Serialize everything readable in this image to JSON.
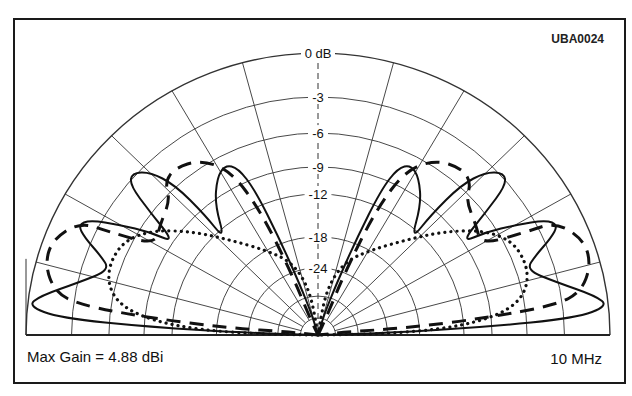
{
  "figure_id": "UBA0024",
  "footer": {
    "max_gain": "Max Gain = 4.88 dBi",
    "frequency": "10 MHz"
  },
  "chart_data": {
    "type": "polar",
    "subtype": "elevation radiation pattern (half-plane)",
    "title": "",
    "annotations": [
      "UBA0024",
      "Max Gain = 4.88 dBi",
      "10 MHz"
    ],
    "radial_axis": {
      "unit": "dB",
      "tick_labels": [
        "0 dB",
        "-3",
        "-6",
        "-9",
        "-12",
        "-18",
        "-24"
      ],
      "ring_values_db": [
        0,
        -3,
        -6,
        -9,
        -12,
        -18,
        -24,
        -30,
        -40
      ],
      "ring_radius_fraction": [
        1.0,
        0.844,
        0.716,
        0.596,
        0.5,
        0.348,
        0.238,
        0.138,
        0.06
      ]
    },
    "angular_axis": {
      "range_deg": [
        0,
        180
      ],
      "spoke_step_deg": 15,
      "spokes_deg": [
        15,
        30,
        45,
        60,
        75,
        90,
        105,
        120,
        135,
        150,
        165
      ]
    },
    "geometry": {
      "cx": 318,
      "cy": 335,
      "rx": 292,
      "ry": 282
    },
    "series": [
      {
        "name": "solid",
        "style": "solid",
        "description": "Multi-lobe pattern; peak lobes near -9 dB at ~40° and ~60° elevation, low-angle lobe reaching 0 dB ring near horizon",
        "points_px_left": [
          [
            318,
            335
          ],
          [
            250,
            333
          ],
          [
            150,
            327
          ],
          [
            60,
            318
          ],
          [
            28,
            306
          ],
          [
            40,
            296
          ],
          [
            80,
            282
          ],
          [
            110,
            270
          ],
          [
            100,
            255
          ],
          [
            85,
            238
          ],
          [
            78,
            225
          ],
          [
            90,
            220
          ],
          [
            120,
            225
          ],
          [
            150,
            232
          ],
          [
            175,
            243
          ],
          [
            150,
            212
          ],
          [
            130,
            185
          ],
          [
            132,
            173
          ],
          [
            150,
            172
          ],
          [
            175,
            185
          ],
          [
            205,
            215
          ],
          [
            225,
            240
          ],
          [
            215,
            205
          ],
          [
            217,
            178
          ],
          [
            225,
            165
          ],
          [
            238,
            168
          ],
          [
            255,
            190
          ],
          [
            280,
            240
          ],
          [
            300,
            285
          ],
          [
            312,
            315
          ],
          [
            318,
            335
          ]
        ]
      },
      {
        "name": "dashed",
        "style": "dashed",
        "description": "Lobes peaking near -9 dB around 55° and -6 dB region at low angles",
        "points_px_left": [
          [
            318,
            335
          ],
          [
            290,
            332
          ],
          [
            230,
            328
          ],
          [
            150,
            318
          ],
          [
            80,
            305
          ],
          [
            55,
            292
          ],
          [
            45,
            265
          ],
          [
            52,
            240
          ],
          [
            80,
            222
          ],
          [
            110,
            232
          ],
          [
            155,
            245
          ],
          [
            160,
            225
          ],
          [
            170,
            200
          ],
          [
            165,
            182
          ],
          [
            175,
            168
          ],
          [
            200,
            160
          ],
          [
            230,
            170
          ],
          [
            260,
            210
          ],
          [
            290,
            270
          ],
          [
            310,
            318
          ],
          [
            318,
            335
          ]
        ]
      },
      {
        "name": "dotted",
        "style": "dotted",
        "description": "Smooth broad pattern around -18 dB ring, nulls at zenith and horizon",
        "points_px_left": [
          [
            318,
            335
          ],
          [
            260,
            334
          ],
          [
            200,
            330
          ],
          [
            150,
            320
          ],
          [
            120,
            305
          ],
          [
            108,
            285
          ],
          [
            110,
            262
          ],
          [
            125,
            240
          ],
          [
            155,
            230
          ],
          [
            195,
            232
          ],
          [
            230,
            240
          ],
          [
            265,
            250
          ],
          [
            292,
            262
          ],
          [
            310,
            290
          ],
          [
            318,
            335
          ]
        ]
      }
    ],
    "legend": null,
    "grid": true
  }
}
